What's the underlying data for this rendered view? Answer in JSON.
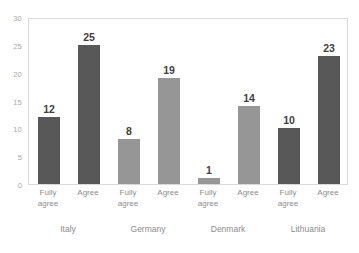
{
  "chart_data": {
    "type": "bar",
    "title": "",
    "subtitle": "",
    "xlabel": "",
    "ylabel": "",
    "ylim": [
      0,
      30
    ],
    "yticks": [
      0,
      5,
      10,
      15,
      20,
      25,
      30
    ],
    "ytick_labels": [
      "0",
      "5",
      "10",
      "15",
      "20",
      "25",
      "30"
    ],
    "grid": false,
    "legend": false,
    "legend_position": "none",
    "groups": [
      "Italy",
      "Germany",
      "Denmark",
      "Lithuania"
    ],
    "categories": [
      "Fully agree",
      "Agree",
      "Fully agree",
      "Agree",
      "Fully agree",
      "Agree",
      "Fully agree",
      "Agree"
    ],
    "values": [
      12,
      25,
      8,
      19,
      1,
      14,
      10,
      23
    ],
    "data_labels": [
      "12",
      "25",
      "8",
      "19",
      "1",
      "14",
      "10",
      "23"
    ],
    "bars": [
      {
        "group": "Italy",
        "category": "Fully agree",
        "label_line1": "Fully",
        "label_line2": "agree",
        "value": 12,
        "data_label": "12",
        "color": "#585858"
      },
      {
        "group": "Italy",
        "category": "Agree",
        "label_line1": "Agree",
        "label_line2": "",
        "value": 25,
        "data_label": "25",
        "color": "#585858"
      },
      {
        "group": "Germany",
        "category": "Fully agree",
        "label_line1": "Fully",
        "label_line2": "agree",
        "value": 8,
        "data_label": "8",
        "color": "#969696"
      },
      {
        "group": "Germany",
        "category": "Agree",
        "label_line1": "Agree",
        "label_line2": "",
        "value": 19,
        "data_label": "19",
        "color": "#969696"
      },
      {
        "group": "Denmark",
        "category": "Fully agree",
        "label_line1": "Fully",
        "label_line2": "agree",
        "value": 1,
        "data_label": "1",
        "color": "#969696"
      },
      {
        "group": "Denmark",
        "category": "Agree",
        "label_line1": "Agree",
        "label_line2": "",
        "value": 14,
        "data_label": "14",
        "color": "#969696"
      },
      {
        "group": "Lithuania",
        "category": "Fully agree",
        "label_line1": "Fully",
        "label_line2": "agree",
        "value": 10,
        "data_label": "10",
        "color": "#585858"
      },
      {
        "group": "Lithuania",
        "category": "Agree",
        "label_line1": "Agree",
        "label_line2": "",
        "value": 23,
        "data_label": "23",
        "color": "#585858"
      }
    ],
    "colors": {
      "dark_series": "#585858",
      "light_series": "#969696",
      "axis_text": "#8c8c8c",
      "tick_text": "#a6a6a6",
      "plot_border": "#d9d9d9",
      "data_label_text": "#3f3f3f",
      "background": "#ffffff"
    }
  }
}
